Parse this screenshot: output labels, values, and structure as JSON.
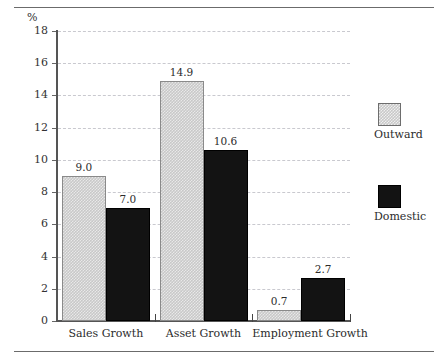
{
  "chart_data": {
    "type": "bar",
    "title": "",
    "subtitle": "",
    "xlabel": "",
    "ylabel": "%",
    "ylim": [
      0,
      18
    ],
    "ytick_values": [
      0,
      2,
      4,
      6,
      8,
      10,
      12,
      14,
      16,
      18
    ],
    "ytick_labels": [
      "0",
      "2",
      "4",
      "6",
      "8",
      "10",
      "12",
      "14",
      "16",
      "18"
    ],
    "grid": true,
    "grid_style": "dashed-horizontal",
    "legend_position": "right",
    "categories": [
      "Sales Growth",
      "Asset Growth",
      "Employment Growth"
    ],
    "series": [
      {
        "name": "Outward",
        "color": "#c8c8c8",
        "pattern": "checkered",
        "values": [
          9.0,
          14.9,
          0.7
        ],
        "labels": [
          "9.0",
          "14.9",
          "0.7"
        ]
      },
      {
        "name": "Domestic",
        "color": "#131313",
        "pattern": "solid",
        "values": [
          7.0,
          10.6,
          2.7
        ],
        "labels": [
          "7.0",
          "10.6",
          "2.7"
        ]
      }
    ]
  },
  "axis": {
    "unit_label": "%"
  },
  "legend": {
    "items": [
      {
        "label": "Outward",
        "swatch": "outward"
      },
      {
        "label": "Domestic",
        "swatch": "domestic"
      }
    ]
  }
}
